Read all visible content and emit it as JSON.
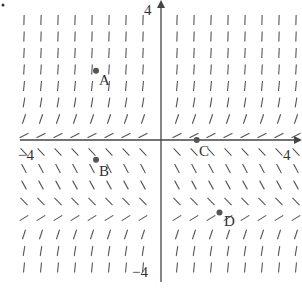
{
  "figure": {
    "type": "slope_field",
    "axes": {
      "x_tick_labels": {
        "min": "−4",
        "max": "4"
      },
      "y_tick_labels": {
        "min": "−4",
        "max": "4"
      },
      "xrange": [
        -4,
        4
      ],
      "yrange": [
        -4,
        4
      ]
    },
    "equilibria_rows": [
      0,
      -2.2
    ],
    "points": [
      {
        "label": "A",
        "x": -2.0,
        "y": 2.1
      },
      {
        "label": "B",
        "x": -2.0,
        "y": -0.6
      },
      {
        "label": "C",
        "x": 1.1,
        "y": 0.0
      },
      {
        "label": "D",
        "x": 1.8,
        "y": -2.2
      }
    ],
    "colors": {
      "ink": "#555555",
      "axis": "#444444",
      "point": "#555555"
    }
  },
  "chart_data": {
    "type": "scatter",
    "title": "",
    "xlabel": "",
    "ylabel": "",
    "xlim": [
      -4,
      4
    ],
    "ylim": [
      -4,
      4
    ],
    "grid": false,
    "series": [
      {
        "name": "points",
        "x": [
          -2.0,
          -2.0,
          1.1,
          1.8
        ],
        "y": [
          2.1,
          -0.6,
          0.0,
          -2.2
        ],
        "labels": [
          "A",
          "B",
          "C",
          "D"
        ]
      }
    ],
    "annotations": [
      "slope field with horizontal slopes near y=0 and y≈-2.2"
    ]
  }
}
